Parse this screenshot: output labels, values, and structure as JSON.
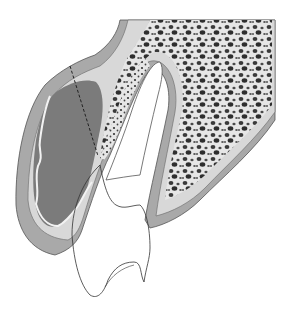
{
  "diagram": {
    "type": "anatomical-cross-section",
    "regions": [
      {
        "id": "outer-cortical-layer",
        "fill": "#a9a9a9"
      },
      {
        "id": "inner-cortical-layer",
        "fill": "#d6d6d6"
      },
      {
        "id": "soft-tissue-mass",
        "fill": "#7a7a7a"
      },
      {
        "id": "cancellous-bone",
        "fill": "#e4e4e4",
        "pore_color": "#3c3c3c"
      },
      {
        "id": "tooth-outline",
        "stroke": "#333333"
      },
      {
        "id": "dashed-cut-line",
        "stroke": "#222222"
      }
    ],
    "colors": {
      "background": "#ffffff",
      "outer_layer": "#a9a9a9",
      "inner_layer": "#d8d8d8",
      "mass": "#7b7b7b",
      "outline": "#444444"
    }
  }
}
